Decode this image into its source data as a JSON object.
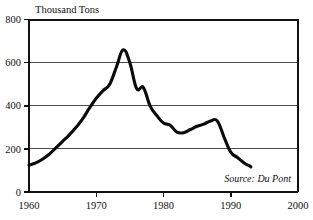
{
  "chart_data": {
    "type": "line",
    "title": "Thousand Tons",
    "xlabel": "",
    "ylabel": "Thousand Tons",
    "xlim": [
      1960,
      2000
    ],
    "ylim": [
      0,
      800
    ],
    "grid": true,
    "legend": null,
    "source_note": "Source: Du Pont",
    "y_ticks": [
      "0",
      "200",
      "400",
      "600",
      "800"
    ],
    "y_tick_values": [
      0,
      200,
      400,
      600,
      800
    ],
    "x_ticks": [
      "1960",
      "1970",
      "1980",
      "1990",
      "2000"
    ],
    "x_tick_values": [
      1960,
      1970,
      1980,
      1990,
      2000
    ],
    "series": [
      {
        "name": "Production",
        "color": "#0a0a0a",
        "x": [
          1960,
          1961,
          1962,
          1963,
          1964,
          1965,
          1966,
          1967,
          1968,
          1969,
          1970,
          1971,
          1972,
          1973,
          1974,
          1975,
          1976,
          1977,
          1978,
          1979,
          1980,
          1981,
          1982,
          1983,
          1984,
          1985,
          1986,
          1987,
          1988,
          1989,
          1990,
          1991,
          1992,
          1993
        ],
        "values": [
          125,
          135,
          152,
          175,
          205,
          235,
          265,
          300,
          340,
          390,
          435,
          470,
          500,
          580,
          660,
          600,
          480,
          485,
          400,
          355,
          320,
          310,
          278,
          275,
          290,
          305,
          315,
          330,
          330,
          255,
          185,
          160,
          135,
          117
        ]
      }
    ]
  },
  "labels": {
    "y_axis_title": "Thousand Tons",
    "source": "Source: Du Pont"
  }
}
